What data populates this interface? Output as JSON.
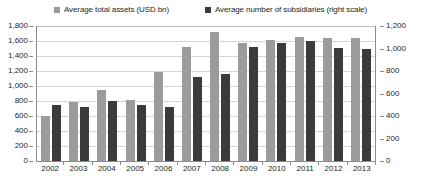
{
  "chart_data": {
    "type": "bar",
    "title": "",
    "subtitle": "",
    "xlabel": "",
    "ylabel": "",
    "y2label": "",
    "grid": true,
    "legend_position": "top",
    "categories": [
      "2002",
      "2003",
      "2004",
      "2005",
      "2006",
      "2007",
      "2008",
      "2009",
      "2010",
      "2011",
      "2012",
      "2013"
    ],
    "ylim": [
      0,
      1800
    ],
    "y2lim": [
      0,
      1200
    ],
    "yticks": [
      "1,800",
      "1,600",
      "1,400",
      "1,200",
      "1,000",
      "800",
      "600",
      "400",
      "200",
      "0"
    ],
    "y2ticks": [
      "1,200",
      "1,000",
      "800",
      "600",
      "400",
      "200",
      "0"
    ],
    "series": [
      {
        "name": "Average total assets (USD bn)",
        "axis": "left",
        "color": "#9b9b9b",
        "values": [
          600,
          790,
          950,
          810,
          1190,
          1520,
          1720,
          1580,
          1620,
          1660,
          1640,
          1640
        ]
      },
      {
        "name": "Average number of subsidiaries (right scale)",
        "axis": "right",
        "color": "#3b3b3b",
        "values": [
          500,
          480,
          530,
          500,
          480,
          750,
          775,
          1010,
          1045,
          1070,
          1005,
          995
        ]
      }
    ]
  },
  "legend": {
    "items": [
      {
        "label": "Average total assets (USD bn)",
        "color": "#9b9b9b",
        "marker": "square-marker-gray"
      },
      {
        "label": "Average number of subsidiaries (right scale)",
        "color": "#3b3b3b",
        "marker": "square-marker-dark"
      }
    ]
  }
}
